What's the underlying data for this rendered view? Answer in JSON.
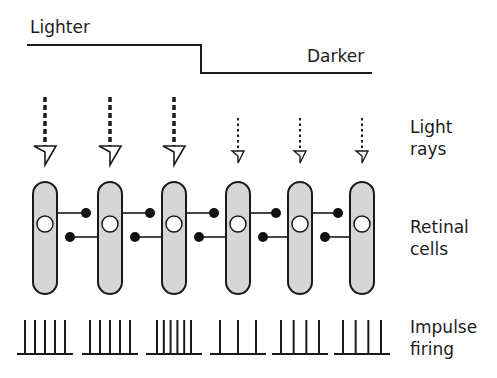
{
  "labels": {
    "lighter": "Lighter",
    "darker": "Darker",
    "light_rays": [
      "Light",
      "rays"
    ],
    "retinal_cells": [
      "Retinal",
      "cells"
    ],
    "impulse_firing": [
      "Impulse",
      "firing"
    ]
  },
  "colors": {
    "stroke": "#1a1a1a",
    "cell_fill": "#d6d6d6",
    "nucleus_fill": "#ffffff",
    "synapse_dot": "#111111"
  },
  "step_line": {
    "lighter_level_y": 45,
    "darker_level_y": 73,
    "x_start": 27,
    "x_step": 201,
    "x_end": 372
  },
  "cells": [
    {
      "x": 45,
      "light": "strong",
      "spikes": 5
    },
    {
      "x": 110,
      "light": "strong",
      "spikes": 5
    },
    {
      "x": 174,
      "light": "strong",
      "spikes": 6
    },
    {
      "x": 238,
      "light": "weak",
      "spikes": 3
    },
    {
      "x": 300,
      "light": "weak",
      "spikes": 4
    },
    {
      "x": 362,
      "light": "weak",
      "spikes": 4
    }
  ]
}
